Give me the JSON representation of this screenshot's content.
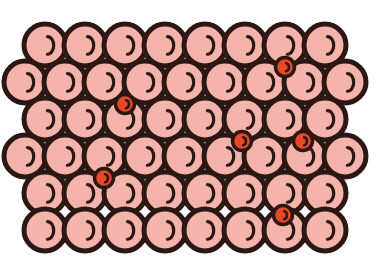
{
  "figure": {
    "title": "",
    "type": "crystal-lattice-diagram",
    "concept": "interstitial-solid-solution",
    "background_color": "#ffffff"
  },
  "palette": {
    "host_fill": "#f4b3ab",
    "host_stroke": "#2b1713",
    "host_highlight": "#2b1713",
    "solute_fill": "#e8482a",
    "solute_stroke": "#2b1713",
    "solute_highlight": "#2b1713"
  },
  "geometry": {
    "host_radius": 21,
    "host_stroke_width": 5,
    "solute_radius": 9.5,
    "solute_stroke_width": 3.5,
    "row_spacing": 37,
    "column_spacing": 40,
    "first_row_y": 45,
    "odd_row_start_x": 45,
    "even_row_start_x": 65,
    "odd_row_count": 8,
    "even_row_count": 9
  },
  "atoms": {
    "host_label": "host atom",
    "solute_label": "interstitial atom",
    "host_count": 50,
    "solute_count": 6,
    "rows": [
      {
        "index": 1,
        "offset": "odd",
        "count": 8,
        "start_x": 45,
        "y": 45,
        "spacing": 40
      },
      {
        "index": 2,
        "offset": "even",
        "count": 9,
        "start_x": 25,
        "y": 82,
        "spacing": 40
      },
      {
        "index": 3,
        "offset": "odd",
        "count": 8,
        "start_x": 45,
        "y": 119,
        "spacing": 40
      },
      {
        "index": 4,
        "offset": "even",
        "count": 9,
        "start_x": 25,
        "y": 156,
        "spacing": 40
      },
      {
        "index": 5,
        "offset": "odd",
        "count": 8,
        "start_x": 45,
        "y": 193,
        "spacing": 40
      },
      {
        "index": 6,
        "offset": "even",
        "count": 8,
        "start_x": 45,
        "y": 230,
        "spacing": 40
      }
    ]
  },
  "solutes": [
    {
      "id": 1,
      "cx": 285,
      "cy": 67,
      "between_rows": "1-2",
      "label": "interstitial atom"
    },
    {
      "id": 2,
      "cx": 125,
      "cy": 104,
      "between_rows": "2-3",
      "label": "interstitial atom"
    },
    {
      "id": 3,
      "cx": 242,
      "cy": 141,
      "between_rows": "3-4",
      "label": "interstitial atom"
    },
    {
      "id": 4,
      "cx": 104,
      "cy": 178,
      "between_rows": "4-5",
      "label": "interstitial atom"
    },
    {
      "id": 5,
      "cx": 283,
      "cy": 215,
      "between_rows": "5-6",
      "label": "interstitial atom"
    },
    {
      "id": 6,
      "cx": 303,
      "cy": 141,
      "between_rows": "3-4",
      "label": "interstitial atom"
    }
  ]
}
